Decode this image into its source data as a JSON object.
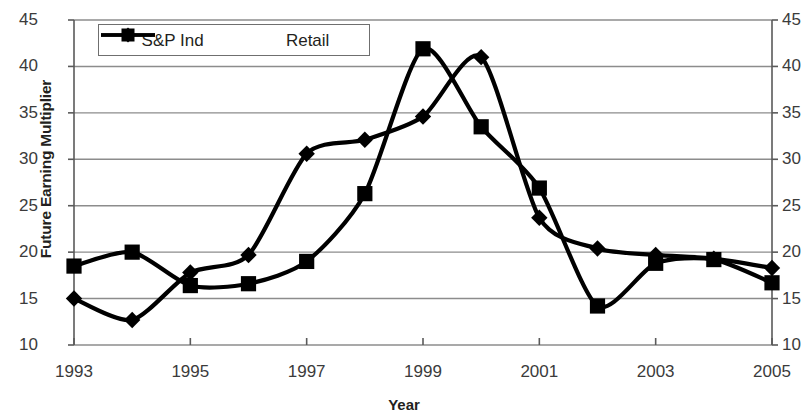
{
  "chart_data": {
    "type": "line",
    "title": "",
    "xlabel": "Year",
    "ylabel": "Future Earning Multiplier",
    "x": [
      1993,
      1994,
      1995,
      1996,
      1997,
      1998,
      1999,
      2000,
      2001,
      2002,
      2003,
      2004,
      2005
    ],
    "xlim": [
      1993,
      2005
    ],
    "ylim": [
      10,
      45
    ],
    "xticks": [
      "1993",
      "1995",
      "1997",
      "1999",
      "2001",
      "2003",
      "2005"
    ],
    "xtick_values": [
      1993,
      1995,
      1997,
      1999,
      2001,
      2003,
      2005
    ],
    "yticks": [
      "10",
      "15",
      "20",
      "25",
      "30",
      "35",
      "40",
      "45"
    ],
    "ytick_values": [
      10,
      15,
      20,
      25,
      30,
      35,
      40,
      45
    ],
    "grid": "horizontal",
    "legend_position": "top-left-inside",
    "axes": "mirrored y-axis labels on left and right",
    "series": [
      {
        "name": "S&P Ind",
        "marker": "diamond",
        "color": "#000000",
        "values": [
          15.0,
          12.7,
          17.8,
          19.7,
          30.6,
          32.1,
          34.6,
          41.0,
          23.7,
          20.4,
          19.7,
          19.3,
          18.3
        ]
      },
      {
        "name": "Retail",
        "marker": "square",
        "color": "#000000",
        "values": [
          18.5,
          20.0,
          16.4,
          16.6,
          19.0,
          26.3,
          41.9,
          33.5,
          26.9,
          14.2,
          18.8,
          19.2,
          16.7
        ]
      }
    ]
  },
  "legend": {
    "entries": [
      {
        "label": "S&P Ind",
        "marker": "diamond"
      },
      {
        "label": "Retail",
        "marker": "square"
      }
    ]
  }
}
